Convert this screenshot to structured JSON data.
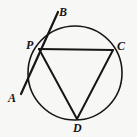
{
  "figure": {
    "kind": "geometry-diagram",
    "background_color": "#f7f7f6",
    "stroke_color": "#161616",
    "label_color": "#161616"
  },
  "labels": {
    "A": "A",
    "B": "B",
    "C": "C",
    "D": "D",
    "P": "P"
  },
  "chart_data": {
    "type": "scatter",
    "title": "",
    "xlabel": "",
    "ylabel": "",
    "circle": {
      "center_x": 75,
      "center_y": 73,
      "radius": 47,
      "stroke_width": 1.6
    },
    "points": {
      "A": {
        "x": 21,
        "y": 94
      },
      "B": {
        "x": 58,
        "y": 12
      },
      "C": {
        "x": 113,
        "y": 50
      },
      "D": {
        "x": 77,
        "y": 119
      },
      "P": {
        "x": 39,
        "y": 49
      }
    },
    "segments": [
      {
        "name": "line-AB",
        "from": "A",
        "to": "B",
        "stroke_width": 2.2
      },
      {
        "name": "chord-PC",
        "from": "P",
        "to": "C",
        "stroke_width": 2.0
      },
      {
        "name": "chord-PD",
        "from": "P",
        "to": "D",
        "stroke_width": 2.0
      },
      {
        "name": "chord-CD",
        "from": "C",
        "to": "D",
        "stroke_width": 2.0
      }
    ],
    "grid": false,
    "legend": "none"
  }
}
